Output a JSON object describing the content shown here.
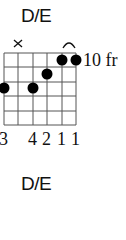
{
  "diagram": {
    "title": "D/E",
    "start_fret_label": "10 fr",
    "strings": 6,
    "frets_shown": 5,
    "muted_strings": [
      2
    ],
    "dots": [
      {
        "string": 1,
        "fret": 3
      },
      {
        "string": 3,
        "fret": 3
      },
      {
        "string": 4,
        "fret": 2
      },
      {
        "string": 5,
        "fret": 1
      },
      {
        "string": 6,
        "fret": 1
      }
    ],
    "barre": {
      "from_string": 5,
      "to_string": 6,
      "fret": 1
    },
    "fingering": [
      "3",
      "",
      "4",
      "2",
      "1",
      "1"
    ],
    "fingering_text": "3   4211"
  },
  "secondary": {
    "title": "D/E"
  }
}
